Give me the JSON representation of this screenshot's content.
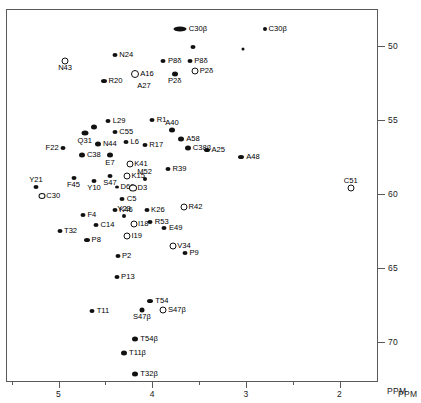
{
  "chart_data": {
    "type": "scatter",
    "title": "",
    "xlabel": "PPM",
    "ylabel": "PPM",
    "xlim": [
      5.55,
      1.6
    ],
    "ylim": [
      47.6,
      72.6
    ],
    "grid": false,
    "legend": "none",
    "x_ticks": [
      {
        "value": 5,
        "label": "5"
      },
      {
        "value": 4,
        "label": "4"
      },
      {
        "value": 3,
        "label": "3"
      },
      {
        "value": 2,
        "label": "2"
      }
    ],
    "x_minor_ticks": [
      5.5,
      4.5,
      3.5,
      2.5
    ],
    "y_ticks": [
      {
        "value": 50,
        "label": "50"
      },
      {
        "value": 55,
        "label": "55"
      },
      {
        "value": 60,
        "label": "60"
      },
      {
        "value": 65,
        "label": "65"
      },
      {
        "value": 70,
        "label": "70"
      }
    ],
    "points": [
      {
        "label": "C30β",
        "x": 3.7,
        "y": 48.9,
        "marker": "filled",
        "w": 13,
        "h": 5,
        "pos": "right"
      },
      {
        "label": "C30β",
        "x": 2.8,
        "y": 48.9,
        "marker": "filled",
        "w": 4,
        "h": 4,
        "pos": "right"
      },
      {
        "label": "",
        "x": 3.56,
        "y": 50.1,
        "marker": "filled",
        "w": 5,
        "h": 4,
        "pos": "right"
      },
      {
        "label": "",
        "x": 3.03,
        "y": 50.2,
        "marker": "filled",
        "w": 3,
        "h": 3,
        "pos": "right"
      },
      {
        "label": "N43",
        "x": 4.93,
        "y": 51.0,
        "marker": "open",
        "w": 5,
        "h": 5,
        "pos": "below"
      },
      {
        "label": "N24",
        "x": 4.4,
        "y": 50.6,
        "marker": "filled",
        "w": 5,
        "h": 4,
        "pos": "right"
      },
      {
        "label": "P8δ",
        "x": 3.88,
        "y": 51.0,
        "marker": "filled",
        "w": 5,
        "h": 4,
        "pos": "right"
      },
      {
        "label": "P8δ",
        "x": 3.6,
        "y": 51.0,
        "marker": "filled",
        "w": 5,
        "h": 4,
        "pos": "right"
      },
      {
        "label": "P2δ",
        "x": 3.76,
        "y": 51.9,
        "marker": "filled",
        "w": 6,
        "h": 5,
        "pos": "below"
      },
      {
        "label": "P2δ",
        "x": 3.54,
        "y": 51.7,
        "marker": "open",
        "w": 5,
        "h": 5,
        "pos": "right"
      },
      {
        "label": "R20",
        "x": 4.52,
        "y": 52.4,
        "marker": "filled",
        "w": 6,
        "h": 4,
        "pos": "right"
      },
      {
        "label": "A16",
        "x": 4.18,
        "y": 51.9,
        "marker": "open",
        "w": 6,
        "h": 6,
        "pos": "right"
      },
      {
        "label": "A27",
        "x": 4.18,
        "y": 52.7,
        "marker": "none",
        "w": 0,
        "h": 0,
        "pos": "right"
      },
      {
        "label": "L29",
        "x": 4.47,
        "y": 55.1,
        "marker": "filled",
        "w": 5,
        "h": 4,
        "pos": "right"
      },
      {
        "label": "R1",
        "x": 4.0,
        "y": 55.0,
        "marker": "filled",
        "w": 5,
        "h": 4,
        "pos": "right"
      },
      {
        "label": "A40",
        "x": 3.79,
        "y": 55.7,
        "marker": "filled",
        "w": 6,
        "h": 5,
        "pos": "above"
      },
      {
        "label": "",
        "x": 4.62,
        "y": 55.5,
        "marker": "filled",
        "w": 6,
        "h": 5,
        "pos": "right"
      },
      {
        "label": "Q31",
        "x": 4.72,
        "y": 55.9,
        "marker": "filled",
        "w": 7,
        "h": 5,
        "pos": "below"
      },
      {
        "label": "C55",
        "x": 4.4,
        "y": 55.8,
        "marker": "filled",
        "w": 5,
        "h": 4,
        "pos": "right"
      },
      {
        "label": "A58",
        "x": 3.69,
        "y": 56.3,
        "marker": "filled",
        "w": 6,
        "h": 5,
        "pos": "right"
      },
      {
        "label": "C38β",
        "x": 3.62,
        "y": 56.9,
        "marker": "filled",
        "w": 6,
        "h": 5,
        "pos": "right"
      },
      {
        "label": "N44",
        "x": 4.58,
        "y": 56.6,
        "marker": "filled",
        "w": 6,
        "h": 5,
        "pos": "right"
      },
      {
        "label": "L6",
        "x": 4.28,
        "y": 56.5,
        "marker": "filled",
        "w": 5,
        "h": 4,
        "pos": "right"
      },
      {
        "label": "R17",
        "x": 4.08,
        "y": 56.7,
        "marker": "filled",
        "w": 5,
        "h": 4,
        "pos": "right"
      },
      {
        "label": "A25",
        "x": 3.42,
        "y": 57.0,
        "marker": "filled",
        "w": 6,
        "h": 4,
        "pos": "right"
      },
      {
        "label": "F22",
        "x": 4.95,
        "y": 56.9,
        "marker": "filled",
        "w": 5,
        "h": 4,
        "pos": "left"
      },
      {
        "label": "C38",
        "x": 4.75,
        "y": 57.4,
        "marker": "filled",
        "w": 6,
        "h": 5,
        "pos": "right"
      },
      {
        "label": "E7",
        "x": 4.45,
        "y": 57.4,
        "marker": "filled",
        "w": 6,
        "h": 5,
        "pos": "below"
      },
      {
        "label": "K41",
        "x": 4.24,
        "y": 58.0,
        "marker": "open",
        "w": 5,
        "h": 5,
        "pos": "right"
      },
      {
        "label": "A48",
        "x": 3.05,
        "y": 57.5,
        "marker": "filled",
        "w": 6,
        "h": 4,
        "pos": "right"
      },
      {
        "label": "S47",
        "x": 4.45,
        "y": 58.8,
        "marker": "filled",
        "w": 5,
        "h": 4,
        "pos": "below"
      },
      {
        "label": "K15",
        "x": 4.27,
        "y": 58.8,
        "marker": "open",
        "w": 5,
        "h": 5,
        "pos": "right"
      },
      {
        "label": "M52",
        "x": 4.08,
        "y": 59.0,
        "marker": "filled",
        "w": 4,
        "h": 4,
        "pos": "above"
      },
      {
        "label": "R39",
        "x": 3.83,
        "y": 58.3,
        "marker": "filled",
        "w": 5,
        "h": 4,
        "pos": "right"
      },
      {
        "label": "F45",
        "x": 4.84,
        "y": 58.9,
        "marker": "filled",
        "w": 5,
        "h": 4,
        "pos": "below"
      },
      {
        "label": "Y10",
        "x": 4.62,
        "y": 59.1,
        "marker": "filled",
        "w": 5,
        "h": 4,
        "pos": "below"
      },
      {
        "label": "D60",
        "x": 4.38,
        "y": 59.5,
        "marker": "filled",
        "w": 4,
        "h": 3,
        "pos": "right"
      },
      {
        "label": "D3",
        "x": 4.21,
        "y": 59.6,
        "marker": "open",
        "w": 6,
        "h": 5,
        "pos": "right"
      },
      {
        "label": "Y21",
        "x": 5.24,
        "y": 59.5,
        "marker": "filled",
        "w": 5,
        "h": 4,
        "pos": "above"
      },
      {
        "label": "C30",
        "x": 5.18,
        "y": 60.1,
        "marker": "open",
        "w": 5,
        "h": 4,
        "pos": "right"
      },
      {
        "label": "C51",
        "x": 1.88,
        "y": 59.6,
        "marker": "open",
        "w": 5,
        "h": 5,
        "pos": "above"
      },
      {
        "label": "C5",
        "x": 4.32,
        "y": 60.3,
        "marker": "filled",
        "w": 5,
        "h": 4,
        "pos": "right"
      },
      {
        "label": "K46",
        "x": 4.4,
        "y": 61.1,
        "marker": "filled",
        "w": 5,
        "h": 4,
        "pos": "right"
      },
      {
        "label": "K26",
        "x": 4.06,
        "y": 61.1,
        "marker": "filled",
        "w": 5,
        "h": 4,
        "pos": "right"
      },
      {
        "label": "R42",
        "x": 3.66,
        "y": 60.9,
        "marker": "open",
        "w": 5,
        "h": 5,
        "pos": "right"
      },
      {
        "label": "F4",
        "x": 4.74,
        "y": 61.4,
        "marker": "filled",
        "w": 5,
        "h": 4,
        "pos": "right"
      },
      {
        "label": "Y23",
        "x": 4.3,
        "y": 61.5,
        "marker": "filled",
        "w": 4,
        "h": 4,
        "pos": "above"
      },
      {
        "label": "R53",
        "x": 4.02,
        "y": 61.9,
        "marker": "filled",
        "w": 5,
        "h": 4,
        "pos": "right"
      },
      {
        "label": "I18",
        "x": 4.2,
        "y": 62.0,
        "marker": "open",
        "w": 5,
        "h": 5,
        "pos": "right"
      },
      {
        "label": "E49",
        "x": 3.87,
        "y": 62.3,
        "marker": "filled",
        "w": 5,
        "h": 4,
        "pos": "right"
      },
      {
        "label": "T32",
        "x": 4.99,
        "y": 62.5,
        "marker": "filled",
        "w": 5,
        "h": 4,
        "pos": "right"
      },
      {
        "label": "C14",
        "x": 4.6,
        "y": 62.1,
        "marker": "filled",
        "w": 5,
        "h": 4,
        "pos": "right"
      },
      {
        "label": "I19",
        "x": 4.27,
        "y": 62.8,
        "marker": "open",
        "w": 5,
        "h": 5,
        "pos": "right"
      },
      {
        "label": "P8",
        "x": 4.7,
        "y": 63.1,
        "marker": "filled",
        "w": 6,
        "h": 4,
        "pos": "right"
      },
      {
        "label": "V34",
        "x": 3.78,
        "y": 63.5,
        "marker": "open",
        "w": 5,
        "h": 5,
        "pos": "right"
      },
      {
        "label": "P9",
        "x": 3.65,
        "y": 64.0,
        "marker": "filled",
        "w": 5,
        "h": 4,
        "pos": "right"
      },
      {
        "label": "P2",
        "x": 4.37,
        "y": 64.2,
        "marker": "filled",
        "w": 5,
        "h": 4,
        "pos": "right"
      },
      {
        "label": "P13",
        "x": 4.38,
        "y": 65.6,
        "marker": "filled",
        "w": 5,
        "h": 4,
        "pos": "right"
      },
      {
        "label": "T54",
        "x": 4.02,
        "y": 67.2,
        "marker": "filled",
        "w": 6,
        "h": 4,
        "pos": "right"
      },
      {
        "label": "T11",
        "x": 4.64,
        "y": 67.9,
        "marker": "filled",
        "w": 5,
        "h": 4,
        "pos": "right"
      },
      {
        "label": "S47β",
        "x": 4.11,
        "y": 67.8,
        "marker": "filled",
        "w": 5,
        "h": 5,
        "pos": "below"
      },
      {
        "label": "S47β",
        "x": 3.88,
        "y": 67.8,
        "marker": "open",
        "w": 5,
        "h": 5,
        "pos": "right"
      },
      {
        "label": "T54β",
        "x": 4.18,
        "y": 69.8,
        "marker": "filled",
        "w": 6,
        "h": 5,
        "pos": "right"
      },
      {
        "label": "T11β",
        "x": 4.3,
        "y": 70.7,
        "marker": "filled",
        "w": 6,
        "h": 5,
        "pos": "right"
      },
      {
        "label": "T32β",
        "x": 4.18,
        "y": 72.1,
        "marker": "filled",
        "w": 6,
        "h": 5,
        "pos": "right"
      }
    ]
  }
}
